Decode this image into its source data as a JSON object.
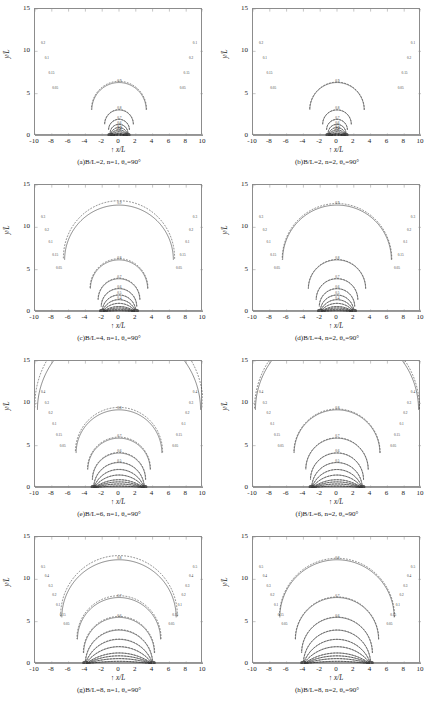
{
  "figure": {
    "axis_labels": {
      "x": "x/L",
      "y": "y/L",
      "x_arrow": "↑"
    },
    "x_ticks": [
      "-10",
      "-8",
      "-6",
      "-4",
      "-2",
      "0",
      "2",
      "4",
      "6",
      "8",
      "10"
    ],
    "x_tick_values": [
      -10,
      -8,
      -6,
      -4,
      -2,
      0,
      2,
      4,
      6,
      8,
      10
    ],
    "y_ticks": [
      "0",
      "5",
      "10",
      "15"
    ],
    "y_tick_values": [
      0,
      5,
      10,
      15
    ],
    "xlim": [
      -10,
      10
    ],
    "ylim": [
      0,
      15
    ],
    "bottom_note": ""
  },
  "panels": [
    {
      "id": "a",
      "caption": "(a)B/L=2, n=1, θ₀=90°",
      "BL": 2,
      "n": 1,
      "theta0": 90,
      "singularity_x": [
        -1,
        1
      ],
      "contour_levels": [
        0.05,
        0.1,
        0.15,
        0.2,
        0.3,
        0.4,
        0.5,
        0.6,
        0.7,
        0.8,
        0.9
      ],
      "inner_labels": [
        "0.3",
        "0.4",
        "0.5",
        "0.6",
        "0.7",
        "0.8",
        "0.9"
      ],
      "left_labels": [
        "0.2",
        "0.1",
        "0.15",
        "0.05"
      ],
      "right_labels": [
        "0.1",
        "0.2",
        "0.15",
        "0.05"
      ]
    },
    {
      "id": "b",
      "caption": "(b)B/L=2, n=2, θ₀=90°",
      "BL": 2,
      "n": 2,
      "theta0": 90,
      "singularity_x": [
        -1,
        1
      ],
      "contour_levels": [
        0.05,
        0.1,
        0.15,
        0.2,
        0.3,
        0.4,
        0.5,
        0.6,
        0.7,
        0.8,
        0.9
      ],
      "inner_labels": [
        "0.3",
        "0.4",
        "0.5",
        "0.6",
        "0.7",
        "0.8",
        "0.9"
      ],
      "left_labels": [
        "0.2",
        "0.1",
        "0.15",
        "0.05"
      ],
      "right_labels": [
        "0.1",
        "0.2",
        "0.15",
        "0.05"
      ]
    },
    {
      "id": "c",
      "caption": "(c)B/L=4, n=1, θ₀=90°",
      "BL": 4,
      "n": 1,
      "theta0": 90,
      "singularity_x": [
        -2,
        2
      ],
      "contour_levels": [
        0.05,
        0.1,
        0.15,
        0.2,
        0.3,
        0.4,
        0.5,
        0.6,
        0.7,
        0.8,
        0.9
      ],
      "inner_labels": [
        "0.4",
        "0.5",
        "0.6",
        "0.7",
        "0.8",
        "0.9"
      ],
      "left_labels": [
        "0.3",
        "0.2",
        "0.1",
        "0.15",
        "0.05"
      ],
      "right_labels": [
        "0.3",
        "0.2",
        "0.1",
        "0.15",
        "0.05"
      ]
    },
    {
      "id": "d",
      "caption": "(d)B/L=4, n=2, θ₀=90°",
      "BL": 4,
      "n": 2,
      "theta0": 90,
      "singularity_x": [
        -2,
        2
      ],
      "contour_levels": [
        0.05,
        0.1,
        0.15,
        0.2,
        0.3,
        0.4,
        0.5,
        0.6,
        0.7,
        0.8,
        0.9
      ],
      "inner_labels": [
        "0.4",
        "0.5",
        "0.6",
        "0.7",
        "0.8",
        "0.9"
      ],
      "left_labels": [
        "0.3",
        "0.2",
        "0.1",
        "0.15",
        "0.05"
      ],
      "right_labels": [
        "0.3",
        "0.2",
        "0.1",
        "0.15",
        "0.05"
      ]
    },
    {
      "id": "e",
      "caption": "(e)B/L=6, n=1, θ₀=90°",
      "BL": 6,
      "n": 1,
      "theta0": 90,
      "singularity_x": [
        -3,
        3
      ],
      "contour_levels": [
        0.05,
        0.1,
        0.15,
        0.2,
        0.3,
        0.4,
        0.5,
        0.6,
        0.7,
        0.8,
        0.9
      ],
      "inner_labels": [
        "0.5",
        "0.6",
        "0.7",
        "0.8",
        "0.9"
      ],
      "left_labels": [
        "0.4",
        "0.3",
        "0.2",
        "0.1",
        "0.15",
        "0.05"
      ],
      "right_labels": [
        "0.4",
        "0.3",
        "0.2",
        "0.1",
        "0.15",
        "0.05"
      ]
    },
    {
      "id": "f",
      "caption": "(f)B/L=6, n=2, θ₀=90°",
      "BL": 6,
      "n": 2,
      "theta0": 90,
      "singularity_x": [
        -3,
        3
      ],
      "contour_levels": [
        0.05,
        0.1,
        0.15,
        0.2,
        0.3,
        0.4,
        0.5,
        0.6,
        0.7,
        0.8,
        0.9
      ],
      "inner_labels": [
        "0.5",
        "0.6",
        "0.7",
        "0.8",
        "0.9"
      ],
      "left_labels": [
        "0.4",
        "0.3",
        "0.2",
        "0.1",
        "0.15",
        "0.05"
      ],
      "right_labels": [
        "0.4",
        "0.3",
        "0.2",
        "0.1",
        "0.15",
        "0.05"
      ]
    },
    {
      "id": "g",
      "caption": "(g)B/L=8, n=1, θ₀=90°",
      "BL": 8,
      "n": 1,
      "theta0": 90,
      "singularity_x": [
        -4,
        4
      ],
      "contour_levels": [
        0.05,
        0.1,
        0.15,
        0.2,
        0.3,
        0.4,
        0.5,
        0.6,
        0.7,
        0.8,
        0.9
      ],
      "inner_labels": [
        "0.6",
        "0.7",
        "0.8",
        "0.9"
      ],
      "left_labels": [
        "0.5",
        "0.4",
        "0.3",
        "0.2",
        "0.1",
        "0.15",
        "0.05"
      ],
      "right_labels": [
        "0.5",
        "0.4",
        "0.3",
        "0.2",
        "0.1",
        "0.15",
        "0.05"
      ]
    },
    {
      "id": "h",
      "caption": "(h)B/L=8, n=2, θ₀=90°",
      "BL": 8,
      "n": 2,
      "theta0": 90,
      "singularity_x": [
        -4,
        4
      ],
      "contour_levels": [
        0.05,
        0.1,
        0.15,
        0.2,
        0.3,
        0.4,
        0.5,
        0.6,
        0.7,
        0.8,
        0.9
      ],
      "inner_labels": [
        "0.6",
        "0.7",
        "0.8",
        "0.9"
      ],
      "left_labels": [
        "0.5",
        "0.4",
        "0.3",
        "0.2",
        "0.1",
        "0.15",
        "0.05"
      ],
      "right_labels": [
        "0.5",
        "0.4",
        "0.3",
        "0.2",
        "0.1",
        "0.15",
        "0.05"
      ]
    }
  ],
  "chart_data": {
    "type": "line",
    "title": "",
    "xlabel": "x/L",
    "ylabel": "y/L",
    "xlim": [
      -10,
      10
    ],
    "ylim": [
      0,
      15
    ],
    "grid": false,
    "legend": "none",
    "series": [
      {
        "name": "solid",
        "style": "solid"
      },
      {
        "name": "dashed",
        "style": "dashed"
      }
    ],
    "contour_levels": [
      0.05,
      0.1,
      0.15,
      0.2,
      0.3,
      0.4,
      0.5,
      0.6,
      0.7,
      0.8,
      0.9
    ],
    "panels": [
      "a",
      "b",
      "c",
      "d",
      "e",
      "f",
      "g",
      "h"
    ]
  }
}
